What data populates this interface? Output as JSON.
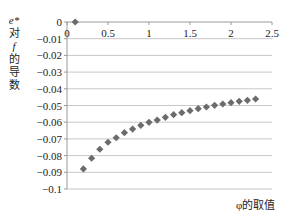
{
  "chart_data": {
    "type": "scatter",
    "title": "",
    "xlabel": "φ的取值",
    "ylabel": "e* 对 f 的导数",
    "ylabel_lines": [
      "e*",
      "对",
      "f",
      "的",
      "导",
      "数"
    ],
    "xlim": [
      0,
      2.5
    ],
    "ylim": [
      -0.1,
      0
    ],
    "x_ticks": [
      "0",
      "0.5",
      "1",
      "1.5",
      "2",
      "2.5"
    ],
    "x_tick_values": [
      0,
      0.5,
      1,
      1.5,
      2,
      2.5
    ],
    "y_ticks": [
      "0",
      "−0.01",
      "−0.02",
      "−0.03",
      "−0.04",
      "−0.05",
      "−0.06",
      "−0.07",
      "−0.08",
      "−0.09",
      "−0.1"
    ],
    "y_tick_values": [
      0,
      -0.01,
      -0.02,
      -0.03,
      -0.04,
      -0.05,
      -0.06,
      -0.07,
      -0.08,
      -0.09,
      -0.1
    ],
    "grid": "horizontal",
    "legend": null,
    "marker": "diamond",
    "marker_color": "#6b6b6b",
    "gridline_color": "#c8c8c8",
    "series": [
      {
        "name": "e*对f的导数",
        "x": [
          0.1,
          0.2,
          0.3,
          0.4,
          0.5,
          0.6,
          0.7,
          0.8,
          0.9,
          1.0,
          1.1,
          1.2,
          1.3,
          1.4,
          1.5,
          1.6,
          1.7,
          1.8,
          1.9,
          2.0,
          2.1,
          2.2,
          2.3
        ],
        "y": [
          0,
          -0.088,
          -0.0816,
          -0.0762,
          -0.072,
          -0.0693,
          -0.0663,
          -0.0641,
          -0.0619,
          -0.0601,
          -0.0587,
          -0.0571,
          -0.0555,
          -0.0543,
          -0.0531,
          -0.0519,
          -0.0509,
          -0.0499,
          -0.0491,
          -0.0483,
          -0.0475,
          -0.0469,
          -0.0461
        ]
      }
    ]
  }
}
